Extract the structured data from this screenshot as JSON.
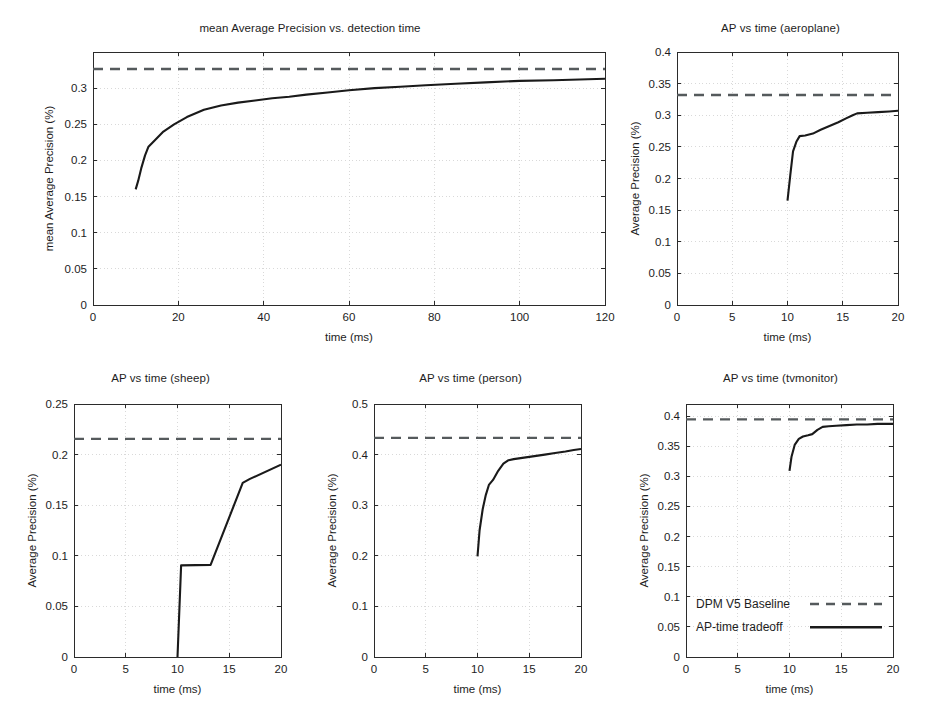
{
  "figure": {
    "background": "#ffffff",
    "width": 941,
    "height": 704,
    "series_colors": {
      "baseline": "#555a5c",
      "tradeoff": "#1a1a1a"
    }
  },
  "legend": {
    "baseline_label": "DPM V5 Baseline",
    "tradeoff_label": "AP-time tradeoff",
    "position": "inside tvmonitor panel, lower-left"
  },
  "chart_data": [
    {
      "id": "map-vs-detection-time",
      "type": "line",
      "title": "mean Average Precision vs. detection time",
      "xlabel": "time (ms)",
      "ylabel": "mean Average Precision (%)",
      "xlim": [
        0,
        120
      ],
      "ylim": [
        0,
        0.35
      ],
      "xticks": [
        0,
        20,
        40,
        60,
        80,
        100,
        120
      ],
      "xtick_labels": [
        "0",
        "20",
        "40",
        "60",
        "80",
        "100",
        "120"
      ],
      "yticks": [
        0,
        0.05,
        0.1,
        0.15,
        0.2,
        0.25,
        0.3
      ],
      "ytick_labels": [
        "0",
        "0.05",
        "0.1",
        "0.15",
        "0.2",
        "0.25",
        "0.3"
      ],
      "grid": true,
      "series": [
        {
          "name": "DPM V5 Baseline",
          "style": "dashed",
          "value": 0.3265,
          "x": [
            0,
            120
          ],
          "y": [
            0.3265,
            0.3265
          ]
        },
        {
          "name": "AP-time tradeoff",
          "style": "solid",
          "x": [
            10.0,
            10.6,
            11.3,
            12.2,
            13.0,
            14.5,
            16.5,
            19.0,
            22.0,
            26.0,
            30.0,
            34.0,
            38.0,
            42.0,
            46.0,
            50.0,
            55.0,
            60.0,
            66.0,
            72.0,
            78.0,
            85.0,
            92.0,
            100.0,
            108.0,
            114.0,
            120.0
          ],
          "y": [
            0.16,
            0.172,
            0.189,
            0.207,
            0.219,
            0.228,
            0.24,
            0.25,
            0.26,
            0.27,
            0.276,
            0.28,
            0.283,
            0.286,
            0.288,
            0.291,
            0.294,
            0.297,
            0.3,
            0.302,
            0.304,
            0.306,
            0.308,
            0.31,
            0.311,
            0.312,
            0.313
          ]
        }
      ]
    },
    {
      "id": "ap-vs-time-aeroplane",
      "type": "line",
      "title": "AP vs time (aeroplane)",
      "xlabel": "time (ms)",
      "ylabel": "Average Precision (%)",
      "xlim": [
        0,
        20
      ],
      "ylim": [
        0,
        0.4
      ],
      "xticks": [
        0,
        5,
        10,
        15,
        20
      ],
      "xtick_labels": [
        "0",
        "5",
        "10",
        "15",
        "20"
      ],
      "yticks": [
        0,
        0.05,
        0.1,
        0.15,
        0.2,
        0.25,
        0.3,
        0.35,
        0.4
      ],
      "ytick_labels": [
        "0",
        "0.05",
        "0.1",
        "0.15",
        "0.2",
        "0.25",
        "0.3",
        "0.35",
        "0.4"
      ],
      "grid": true,
      "series": [
        {
          "name": "DPM V5 Baseline",
          "style": "dashed",
          "value": 0.332,
          "x": [
            0,
            20
          ],
          "y": [
            0.332,
            0.332
          ]
        },
        {
          "name": "AP-time tradeoff",
          "style": "solid",
          "x": [
            10.0,
            10.25,
            10.5,
            10.8,
            11.1,
            11.6,
            12.3,
            13.0,
            13.8,
            14.6,
            15.3,
            15.9,
            16.3,
            17.2,
            18.2,
            19.2,
            20.0
          ],
          "y": [
            0.165,
            0.205,
            0.243,
            0.258,
            0.267,
            0.268,
            0.271,
            0.277,
            0.283,
            0.289,
            0.295,
            0.3,
            0.303,
            0.304,
            0.305,
            0.306,
            0.307
          ]
        }
      ]
    },
    {
      "id": "ap-vs-time-sheep",
      "type": "line",
      "title": "AP vs time (sheep)",
      "xlabel": "time (ms)",
      "ylabel": "Average Precision (%)",
      "xlim": [
        0,
        20
      ],
      "ylim": [
        0,
        0.25
      ],
      "xticks": [
        0,
        5,
        10,
        15,
        20
      ],
      "xtick_labels": [
        "0",
        "5",
        "10",
        "15",
        "20"
      ],
      "yticks": [
        0,
        0.05,
        0.1,
        0.15,
        0.2,
        0.25
      ],
      "ytick_labels": [
        "0",
        "0.05",
        "0.1",
        "0.15",
        "0.2",
        "0.25"
      ],
      "grid": true,
      "series": [
        {
          "name": "DPM V5 Baseline",
          "style": "dashed",
          "value": 0.2155,
          "x": [
            0,
            20
          ],
          "y": [
            0.2155,
            0.2155
          ]
        },
        {
          "name": "AP-time tradeoff",
          "style": "solid",
          "x": [
            9.95,
            10.0,
            10.35,
            13.2,
            16.3,
            17.0,
            20.0
          ],
          "y": [
            0.0,
            0.0,
            0.0905,
            0.091,
            0.172,
            0.176,
            0.19
          ]
        }
      ]
    },
    {
      "id": "ap-vs-time-person",
      "type": "line",
      "title": "AP vs time (person)",
      "xlabel": "time (ms)",
      "ylabel": "Average Precision (%)",
      "xlim": [
        0,
        20
      ],
      "ylim": [
        0,
        0.5
      ],
      "xticks": [
        0,
        5,
        10,
        15,
        20
      ],
      "xtick_labels": [
        "0",
        "5",
        "10",
        "15",
        "20"
      ],
      "yticks": [
        0,
        0.1,
        0.2,
        0.3,
        0.4,
        0.5
      ],
      "ytick_labels": [
        "0",
        "0.1",
        "0.2",
        "0.3",
        "0.4",
        "0.5"
      ],
      "grid": true,
      "series": [
        {
          "name": "DPM V5 Baseline",
          "style": "dashed",
          "value": 0.433,
          "x": [
            0,
            20
          ],
          "y": [
            0.433,
            0.433
          ]
        },
        {
          "name": "AP-time tradeoff",
          "style": "solid",
          "x": [
            10.0,
            10.2,
            10.5,
            10.8,
            11.1,
            11.5,
            12.0,
            12.5,
            13.0,
            13.5,
            14.5,
            15.5,
            16.5,
            17.5,
            18.5,
            19.3,
            20.0
          ],
          "y": [
            0.199,
            0.25,
            0.292,
            0.32,
            0.34,
            0.35,
            0.368,
            0.382,
            0.389,
            0.391,
            0.394,
            0.397,
            0.4,
            0.403,
            0.406,
            0.409,
            0.411
          ]
        }
      ]
    },
    {
      "id": "ap-vs-time-tvmonitor",
      "type": "line",
      "title": "AP vs time (tvmonitor)",
      "xlabel": "time (ms)",
      "ylabel": "Average Precision (%)",
      "xlim": [
        0,
        20
      ],
      "ylim": [
        0,
        0.42
      ],
      "xticks": [
        0,
        5,
        10,
        15,
        20
      ],
      "xtick_labels": [
        "0",
        "5",
        "10",
        "15",
        "20"
      ],
      "yticks": [
        0,
        0.05,
        0.1,
        0.15,
        0.2,
        0.25,
        0.3,
        0.35,
        0.4
      ],
      "ytick_labels": [
        "0",
        "0.05",
        "0.1",
        "0.15",
        "0.2",
        "0.25",
        "0.3",
        "0.35",
        "0.4"
      ],
      "grid": true,
      "series": [
        {
          "name": "DPM V5 Baseline",
          "style": "dashed",
          "value": 0.3945,
          "x": [
            0,
            20
          ],
          "y": [
            0.3945,
            0.3945
          ]
        },
        {
          "name": "AP-time tradeoff",
          "style": "solid",
          "x": [
            10.0,
            10.2,
            10.5,
            10.9,
            11.3,
            11.8,
            12.2,
            12.7,
            13.2,
            13.8,
            14.5,
            15.5,
            16.5,
            17.5,
            18.5,
            19.3,
            20.0
          ],
          "y": [
            0.309,
            0.333,
            0.352,
            0.362,
            0.366,
            0.368,
            0.37,
            0.377,
            0.382,
            0.383,
            0.384,
            0.385,
            0.386,
            0.386,
            0.387,
            0.387,
            0.387
          ]
        }
      ]
    }
  ]
}
